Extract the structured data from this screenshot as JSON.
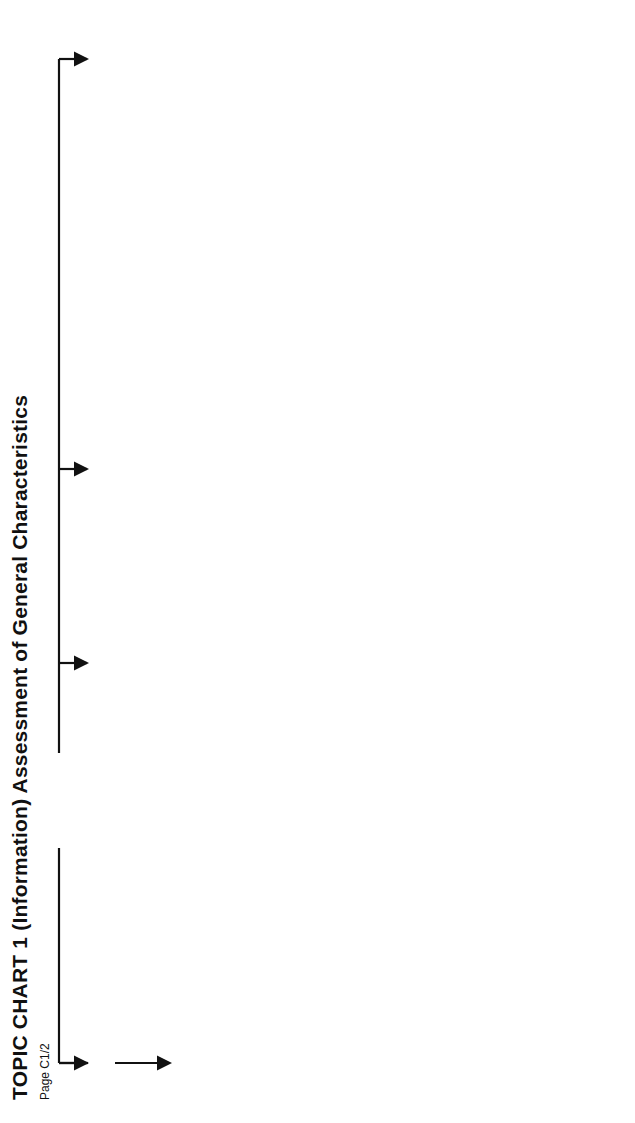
{
  "page": {
    "title": "TOPIC CHART 1 (Information) Assessment of General Characteristics",
    "page_label": "Page C1/2",
    "rotation": "90deg counter-clockwise"
  },
  "flow": {
    "start": "START",
    "and_labels": [
      "AND",
      "AND",
      "&"
    ],
    "columns": [
      {
        "heading": "PURPOSES SUPPLIES & STRUCTURE",
        "boxes": [
          {
            "lines": [
              "Maximum Demand and Diversity"
            ]
          },
          {
            "code": "311 - 01 - 01"
          },
          {
            "lines": [
              "Arrangement of Live Conductors & Type of Earthing"
            ]
          },
          {
            "code": "312 - 01 - 01"
          },
          {
            "code": "312 - 02 - 01",
            "lines": [
              "Number and type of live conductors"
            ]
          },
          {
            "code": "312 - 03 - 01",
            "lines": [
              "Type of earthing arrangement",
              "See 'system' definition"
            ]
          },
          {
            "lines": [
              "Nature of Supply"
            ]
          }
        ],
        "ref_pill": "552 - 01 - 01"
      },
      {
        "boxes": [
          {
            "code": "313 - 01 - 01",
            "lines": [
              "Determine characteristics of source of energy, public or private:",
              "nominal voltage",
              "nature of current and frequency",
              "prospective fault current at installation origin (Ip)",
              "external part of earth fault loop impedance (Ze)",
              "suitability of supply for installation, including maximum demand",
              "type and rating of overcurrent device at origin of installation"
            ]
          },
          {
            "code": "313 - 02 - 01, Chp. 55 & Chp. 56",
            "lines": [
              "Determine characteristics of safety or standby supplies; if to be used in parallel with public supply check with Supplier"
            ]
          }
        ],
        "ref_pill": "BS5266 Emergency lighting, BS5839 Fire alarms."
      },
      {
        "boxes": [
          {
            "lines": [
              "Installation Circuit Arrangements"
            ]
          },
          {
            "code": "314 - 01 - 01 & 02",
            "lines": [
              "Separate circuits arranged to:",
              "avoid danger and minimise inconvenience in event of a fault",
              "facilitate safe operation, inspection, testing and maintenance"
            ]
          },
          {
            "code": "314 - 01 - 03",
            "lines": [
              "Number of final circuits and points relates to:",
              "known or estimated max. demand per circuit",
              "conductor current-carrying capacity",
              "overcurrent protection",
              "isolation and switching"
            ]
          },
          {
            "lines": [
              "Handbook Part D",
              "Recommended circuit arrangements"
            ]
          },
          {
            "code": "314 - 01 - 04",
            "lines": [
              "Circuits to be electrically separate from each other"
            ]
          }
        ],
        "ref_pills": [
          {
            "code": "553 - 01 - 07",
            "text": "Provision of socket-outlets"
          },
          {
            "code": "471 - 16 - 01",
            "text": "Provision of sockets to be used outside zone"
          }
        ]
      },
      {
        "heading": "COMPATIBILITY",
        "boxes": [
          {
            "code": "331 - 01 - 01",
            "lines": [
              "Assess any harmful effects of equipment on other equipment or source of energy"
            ]
          },
          {
            "code": "Sections 515 & 528",
            "lines": [
              "Mutual detrimental influences & physical separation"
            ]
          }
        ],
        "ref_pill": {
          "code": "TC 7",
          "text": "Thermal influences"
        }
      },
      {
        "heading": "EXTERNAL INFLUENCES",
        "boxes": [
          {
            "code": "130 - 08 - 01 & 02",
            "lines": [
              "Precautions in adverse conditions",
              "overvoltage protection"
            ]
          },
          {
            "lines": [
              "See Chapter 32, Chapter 44 and Appendix 5 for guidance"
            ]
          },
          {
            "lines": [
              "Identify:",
              "any adverse environmental conditions, e.g. hot, wet, corrosive, dusty, etc.",
              "type of use of premises; capability of users",
              "type of building construction"
            ]
          }
        ]
      },
      {
        "boxes": [
          {
            "code": "512 - 06 - 01"
          },
          {
            "code": "Section 522",
            "lines": [
              "Environmental conditions – selection of suitable conductors, cables, etc.",
              "and Appendix 5"
            ]
          },
          {
            "lines": [
              "Note:",
              "Identify aggressive water conditions for water heaters"
            ]
          }
        ],
        "ref_pill": "713 - 04"
      },
      {
        "heading": "MAINTAINABILITY",
        "boxes": [
          {
            "code": "130 - 12 - 01 & 513 - 01 - 01",
            "lines": [
              "Accessibility of equipment requiring attention"
            ]
          },
          {
            "code": "341 - 01 - 01",
            "lines": [
              "Assess frequency and quality of maintenance required during intended life of installation"
            ]
          }
        ]
      }
    ],
    "end": {
      "apply": "Apply Assessment to Parts 4 To 6",
      "verification": {
        "line1": "VERIFICATION",
        "line2": "PART 7"
      },
      "finish": {
        "title": "FINISH",
        "text": "Assessment of general characteristics"
      }
    }
  },
  "colors": {
    "line": "#111111",
    "box_border": "#bdbdbd",
    "heading_fill": "#e6e6e6"
  }
}
